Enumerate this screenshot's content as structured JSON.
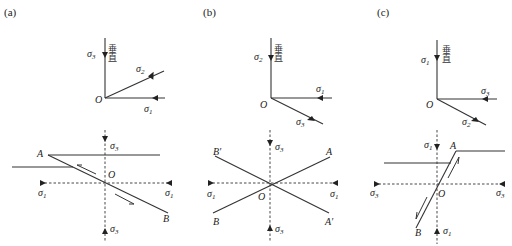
{
  "panels": [
    {
      "id": "a",
      "label": "(a)",
      "orientation": {
        "vertical_label": "垂直",
        "vertical_axis": {
          "symbol": "σ",
          "sub": "3"
        },
        "oblique_axis": {
          "symbol": "σ",
          "sub": "2"
        },
        "horizontal_axis": {
          "symbol": "σ",
          "sub": "1"
        },
        "origin": "O"
      },
      "section": {
        "top": {
          "symbol": "σ",
          "sub": "3"
        },
        "bottom": {
          "symbol": "σ",
          "sub": "3"
        },
        "left": {
          "symbol": "σ",
          "sub": "1"
        },
        "right": {
          "symbol": "σ",
          "sub": "1"
        },
        "origin": "O",
        "point_a": "A",
        "point_b": "B",
        "fault_type": "normal fault"
      }
    },
    {
      "id": "b",
      "label": "(b)",
      "orientation": {
        "vertical_label": "垂直",
        "vertical_axis": {
          "symbol": "σ",
          "sub": "2"
        },
        "horizontal_axis": {
          "symbol": "σ",
          "sub": "1"
        },
        "oblique_axis": {
          "symbol": "σ",
          "sub": "3"
        },
        "origin": "O"
      },
      "section": {
        "top": {
          "symbol": "σ",
          "sub": "3"
        },
        "bottom": {
          "symbol": "σ",
          "sub": "3"
        },
        "left": {
          "symbol": "σ",
          "sub": "1"
        },
        "right": {
          "symbol": "σ",
          "sub": "1"
        },
        "origin": "O",
        "point_a": "A",
        "point_a_prime": "A′",
        "point_b": "B",
        "point_b_prime": "B′",
        "fault_type": "strike-slip conjugate faults"
      }
    },
    {
      "id": "c",
      "label": "(c)",
      "orientation": {
        "vertical_label": "垂直",
        "vertical_axis": {
          "symbol": "σ",
          "sub": "1"
        },
        "horizontal_axis": {
          "symbol": "σ",
          "sub": "3"
        },
        "oblique_axis": {
          "symbol": "σ",
          "sub": "2"
        },
        "origin": "O"
      },
      "section": {
        "top": {
          "symbol": "σ",
          "sub": "1"
        },
        "bottom": {
          "symbol": "σ",
          "sub": "1"
        },
        "left": {
          "symbol": "σ",
          "sub": "3"
        },
        "right": {
          "symbol": "σ",
          "sub": "3"
        },
        "origin": "O",
        "point_a": "A",
        "point_b": "B",
        "fault_type": "reverse fault"
      }
    }
  ]
}
